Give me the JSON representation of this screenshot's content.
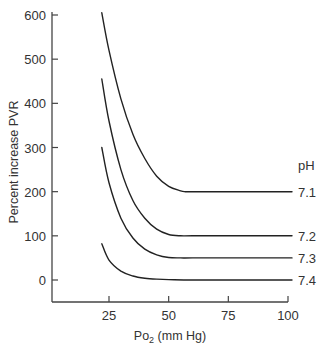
{
  "chart_data": {
    "type": "line",
    "title": "",
    "xlabel": "Po2 (mm Hg)",
    "xlabel_main": "Po",
    "xlabel_sub": "2",
    "xlabel_rest": " (mm Hg)",
    "ylabel": "Percent increase PVR",
    "xlim": [
      0,
      100
    ],
    "ylim": [
      -45,
      610
    ],
    "xticks": [
      25,
      50,
      75,
      100
    ],
    "yticks": [
      0,
      100,
      200,
      300,
      400,
      500,
      600
    ],
    "grid": false,
    "legend_title": "pH",
    "legend_position": "right, inline at curve ends",
    "series": [
      {
        "name": "7.1",
        "x": [
          22,
          25,
          30,
          35,
          40,
          45,
          50,
          55,
          57,
          60,
          80,
          100
        ],
        "y": [
          605,
          520,
          410,
          330,
          275,
          235,
          212,
          202,
          200,
          200,
          200,
          200
        ]
      },
      {
        "name": "7.2",
        "x": [
          22,
          25,
          30,
          35,
          40,
          45,
          50,
          55,
          60,
          80,
          100
        ],
        "y": [
          455,
          360,
          250,
          180,
          140,
          115,
          103,
          100,
          100,
          100,
          100
        ]
      },
      {
        "name": "7.3",
        "x": [
          22,
          25,
          30,
          35,
          40,
          45,
          50,
          55,
          60,
          80,
          100
        ],
        "y": [
          300,
          220,
          140,
          95,
          70,
          57,
          51,
          50,
          50,
          50,
          50
        ]
      },
      {
        "name": "7.4",
        "x": [
          22,
          25,
          30,
          35,
          40,
          45,
          50,
          60,
          80,
          100
        ],
        "y": [
          82,
          45,
          20,
          9,
          4,
          2,
          1,
          0,
          0,
          0
        ]
      }
    ]
  },
  "colors": {
    "line": "#222222",
    "axis": "#444444",
    "text": "#333333",
    "background": "#ffffff"
  }
}
